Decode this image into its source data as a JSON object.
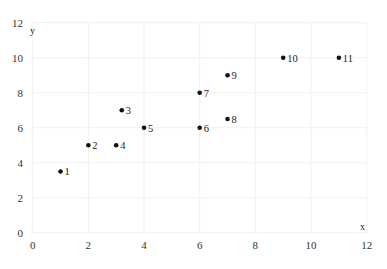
{
  "chart_data": {
    "type": "scatter",
    "title": "",
    "xlabel": "x",
    "ylabel": "y",
    "xlim": [
      0,
      12
    ],
    "ylim": [
      0,
      12
    ],
    "x_ticks": [
      0,
      2,
      4,
      6,
      8,
      10,
      12
    ],
    "y_ticks": [
      0,
      2,
      4,
      6,
      8,
      10,
      12
    ],
    "grid": true,
    "legend": null,
    "points": [
      {
        "label": "1",
        "x": 1,
        "y": 3.5
      },
      {
        "label": "2",
        "x": 2,
        "y": 5
      },
      {
        "label": "3",
        "x": 3.2,
        "y": 7
      },
      {
        "label": "4",
        "x": 3,
        "y": 5
      },
      {
        "label": "5",
        "x": 4,
        "y": 6
      },
      {
        "label": "6",
        "x": 6,
        "y": 6
      },
      {
        "label": "7",
        "x": 6,
        "y": 8
      },
      {
        "label": "8",
        "x": 7,
        "y": 6.5
      },
      {
        "label": "9",
        "x": 7,
        "y": 9
      },
      {
        "label": "10",
        "x": 9,
        "y": 10
      },
      {
        "label": "11",
        "x": 11,
        "y": 10
      }
    ]
  },
  "colors": {
    "point": "#111111",
    "grid": "#f0f0f0",
    "text": "#333333"
  }
}
